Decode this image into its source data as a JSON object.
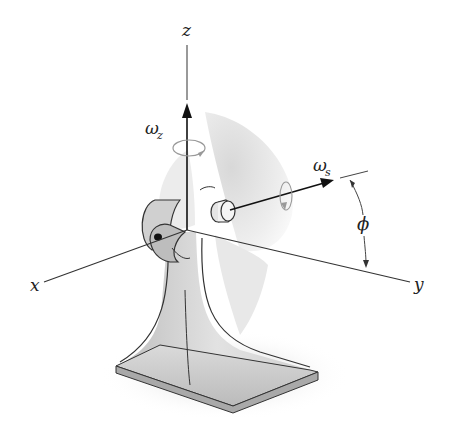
{
  "diagram": {
    "type": "3d-mechanics-figure",
    "axes": {
      "x": "x",
      "y": "y",
      "z": "z"
    },
    "angular_velocities": {
      "omega_z": {
        "symbol": "ω",
        "subscript": "z"
      },
      "omega_s": {
        "symbol": "ω",
        "subscript": "s"
      }
    },
    "angle": {
      "symbol": "ϕ"
    },
    "colors": {
      "line": "#222222",
      "blade": "#e6e6e6",
      "stand": "#cfcfcf",
      "rotation_arrow": "#9a9a9a"
    }
  }
}
